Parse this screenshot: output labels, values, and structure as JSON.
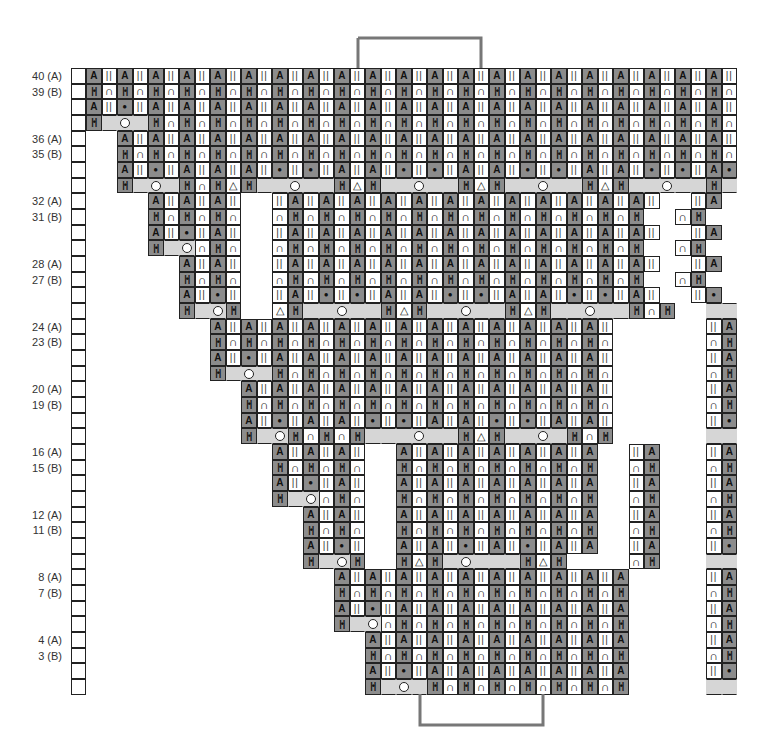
{
  "chart_data": {
    "type": "table",
    "title": "",
    "legend_codes": {
      "A": "dark cell, A symbol",
      "|": "white cell, double bar",
      "n": "white cell, arch",
      "H": "dark cell, H symbol",
      "*": "dark cell, dot",
      "g": "light gray, no stitch",
      "o": "light gray, yarn-over circle",
      "t": "white cell, triangle decrease",
      ".": "no cell"
    },
    "row_labels": [
      {
        "row": 40,
        "text": "40 (A)"
      },
      {
        "row": 39,
        "text": "39 (B)"
      },
      {
        "row": 36,
        "text": "36 (A)"
      },
      {
        "row": 35,
        "text": "35 (B)"
      },
      {
        "row": 32,
        "text": "32 (A)"
      },
      {
        "row": 31,
        "text": "31 (B)"
      },
      {
        "row": 28,
        "text": "28 (A)"
      },
      {
        "row": 27,
        "text": "27 (B)"
      },
      {
        "row": 24,
        "text": "24 (A)"
      },
      {
        "row": 23,
        "text": "23 (B)"
      },
      {
        "row": 20,
        "text": "20 (A)"
      },
      {
        "row": 19,
        "text": "19 (B)"
      },
      {
        "row": 16,
        "text": "16 (A)"
      },
      {
        "row": 15,
        "text": "15 (B)"
      },
      {
        "row": 12,
        "text": "12 (A)"
      },
      {
        "row": 11,
        "text": "11 (B)"
      },
      {
        "row": 8,
        "text": "8 (A)"
      },
      {
        "row": 7,
        "text": "7 (B)"
      },
      {
        "row": 4,
        "text": "4 (A)"
      },
      {
        "row": 3,
        "text": "3 (B)"
      }
    ],
    "columns": 42,
    "rows_top_to_bottom": [
      "A|A|A|A|A|A|A|A|A|A|A|A|A|A|A|A|A|A|A|A|A|",
      "HnHnHnHnHnHnHnHnHnHnHnHnHnHnHnHnHnHnHnHnHn",
      "A|*|A|A|A|A|A|A|A|A|A|A|A|A|A|A|A|A|A|A|A|",
      "HgogHnHnHnHnHnHnHnHnHnHnHnHnHnHnHnHnHnHnHn",
      "..A|A|A|A|A|A|A|A|A|A|A|A|A|A|A|A|A|A|A|A|",
      "..HnHnHnHnHnHnHnHnHnHnHnHnHnHnHnHnHnHnHnHn",
      "..A|*|A|A|A|*|*|A|A|*|*|A|A|*|*|A|A|*|*|A*",
      "..HgogHnHtHggoggHtHggoggHtHggoggHtHggoggHg",
      "....A|A|A|..|A|A|A|A|A|A|A|A|A|A|A|A|..|A",
      "....HnHnHn..nHnHnHnHnHnHnHnHnHnHnHnH..nH",
      "....A|*|A|..|A|A|A|A|A|A|A|A|A|A|A|A|..|A",
      "....HgonHn..nHnHnHnHnHnHnHnHnHnHnHnH..nH",
      "......A|A|..|A|A|A|A|A|A|A|A|A|A|A|A|..|A",
      "......HnHn..nHnHnHnHnHnHnHnHnHnHnHnH..nH",
      "......A|*|..|A|*|*|A|A|*|*|A|A|*|*|A|..|*",
      "......HgoH..tHggoggHtHggoggHtHggoggHnH..gg",
      "........A|A|A|A|A|A|A|A|A|A|A|A|A|......|A",
      "........HnHnHnHnHnHnHnHnHnHnHnHnHn......nH",
      "........A|*|A|A|A|A|A|A|A|A|A|A|A|......|A",
      "........HgogHnHnHnHnHnHnHnHnHnHnHn......nH",
      "..........A|A|A|A|A|A|A|A|A|A|A|A|......|A",
      "..........HnHnHnHnHnHnHnHnHnHnHnHn......nH",
      "..........A|*|A|A|*|*|A|A|*|*|A|A|......|*",
      "..........HgoHnHnHgggoggHtHggogHnH......gg",
      "............A|A|A|..A|A|A|A|A|A|A..|A...|A",
      "............HnHnHn..HnHnHnHnHnHnH..nH...nH",
      "............A|*|A|..A|A|A|A|A|A|A..|A...|A",
      "............HgonHn..HnHnHnHnHnHnH..nH...nH",
      "..............A|A|..A|A|A|A|A|A|A..|A...|A",
      "..............HnHn..HnHnHnHnHnHnH..nH...nH",
      "..............A|*|..A|A|*|A|*|A|A..|A...|*",
      "..............HgoH..HtHgogggHtH....nH...gg",
      "................A|A|A|A|A|A|A|A|A|A.....|A",
      "................HnHnHnHnHnHnHnHnHnH.....nH",
      "................A|*|A|A|A|A|A|A|A|A.....|A",
      "................HgonHnHnHnHnHnHnHnH.....nH",
      "..................A|A|A|A|A|A|A|A|A.....|A",
      "..................HnHnHnHnHnHnHnHnH.....nH",
      "..................A|*|A|A|A|A|A|A|A.....|*",
      "..................HgogHnHnHnHnHnHnH.....gg"
    ]
  }
}
